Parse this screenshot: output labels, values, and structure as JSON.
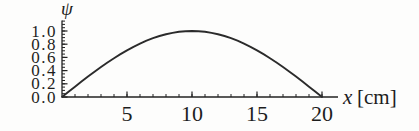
{
  "chart_data": {
    "type": "line",
    "title": "",
    "xlabel": "x [cm]",
    "xlabel_var": "x",
    "xlabel_unit": "[cm]",
    "ylabel": "ψ",
    "xlim": [
      0,
      20
    ],
    "ylim": [
      0,
      1.0
    ],
    "grid": false,
    "legend": "none",
    "x_major_ticks": [
      5,
      10,
      15,
      20
    ],
    "x_minor_step": 1,
    "y_major_ticks": [
      "0.0",
      "0.2",
      "0.4",
      "0.6",
      "0.8",
      "1.0"
    ],
    "y_minor_step": 0.05,
    "axis_color": "#222222",
    "curve_color": "#2b2b2b",
    "series": [
      {
        "name": "ψ",
        "x": [
          0,
          0.5,
          1,
          1.5,
          2,
          2.5,
          3,
          3.5,
          4,
          4.5,
          5,
          5.5,
          6,
          6.5,
          7,
          7.5,
          8,
          8.5,
          9,
          9.5,
          10,
          10.5,
          11,
          11.5,
          12,
          12.5,
          13,
          13.5,
          14,
          14.5,
          15,
          15.5,
          16,
          16.5,
          17,
          17.5,
          18,
          18.5,
          19,
          19.5,
          20
        ],
        "y": [
          0,
          0.078,
          0.156,
          0.233,
          0.309,
          0.383,
          0.454,
          0.523,
          0.588,
          0.649,
          0.707,
          0.76,
          0.809,
          0.853,
          0.891,
          0.924,
          0.951,
          0.972,
          0.988,
          0.997,
          1,
          0.997,
          0.988,
          0.972,
          0.951,
          0.924,
          0.891,
          0.853,
          0.809,
          0.76,
          0.707,
          0.649,
          0.588,
          0.523,
          0.454,
          0.383,
          0.309,
          0.233,
          0.156,
          0.078,
          0
        ]
      }
    ]
  }
}
